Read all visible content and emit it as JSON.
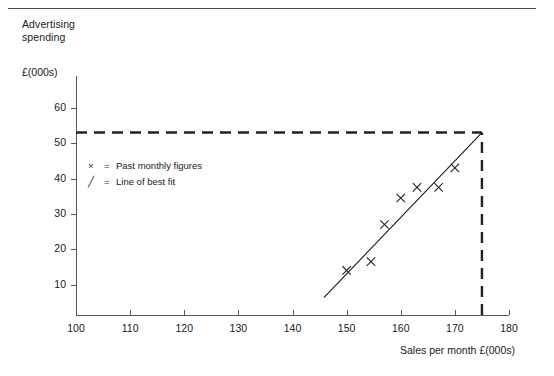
{
  "figure": {
    "y_axis_caption_line1": "Advertising",
    "y_axis_caption_line2": "spending",
    "y_axis_units": "£(000s)",
    "x_axis_title": "Sales per month £(000s)"
  },
  "legend": {
    "items": [
      {
        "mark": "×",
        "eq": "=",
        "label": "Past monthly figures"
      },
      {
        "mark": "╱",
        "eq": "=",
        "label": "Line of best fit"
      }
    ]
  },
  "colors": {
    "ink": "#1a1a1a",
    "axis": "#555555",
    "rule": "#4a4a4a",
    "marker": "#222222",
    "dashed": "#222222"
  },
  "chart_data": {
    "type": "scatter",
    "title": "",
    "xlabel": "Sales per month £(000s)",
    "ylabel": "Advertising spending £(000s)",
    "xlim": [
      100,
      180
    ],
    "ylim": [
      1.4,
      69
    ],
    "xticks": [
      100,
      110,
      120,
      130,
      140,
      150,
      160,
      170,
      180
    ],
    "yticks": [
      10,
      20,
      30,
      40,
      50,
      60
    ],
    "grid": false,
    "legend_position": "inside-upper-left",
    "series": [
      {
        "name": "Past monthly figures",
        "marker": "x",
        "x": [
          150,
          154.5,
          157,
          160,
          163,
          167,
          170
        ],
        "y": [
          14,
          16.5,
          27,
          34.5,
          37.5,
          37.5,
          43
        ]
      }
    ],
    "line_of_best_fit": {
      "name": "Line of best fit",
      "x_start": 145.8,
      "y_start": 6.3,
      "x_end": 175,
      "y_end": 53
    },
    "annotations": [
      {
        "type": "dashed-horizontal",
        "y": 53,
        "x_from": 100,
        "x_to": 175
      },
      {
        "type": "dashed-vertical",
        "x": 175,
        "y_from": 1.4,
        "y_to": 53
      }
    ]
  }
}
